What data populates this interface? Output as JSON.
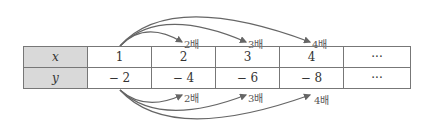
{
  "table": {
    "rows": [
      {
        "header": "x",
        "values": [
          "1",
          "2",
          "3",
          "4",
          "···"
        ]
      },
      {
        "header": "y",
        "values": [
          "− 2",
          "− 4",
          "− 6",
          "− 8",
          "···"
        ]
      }
    ]
  },
  "top_arrows": [
    "2배",
    "3배",
    "4배"
  ],
  "bottom_arrows": [
    "2배",
    "3배",
    "4배"
  ],
  "colors": {
    "header_bg": "#d9d9d9",
    "arrow": "#666666",
    "border": "#777777"
  }
}
